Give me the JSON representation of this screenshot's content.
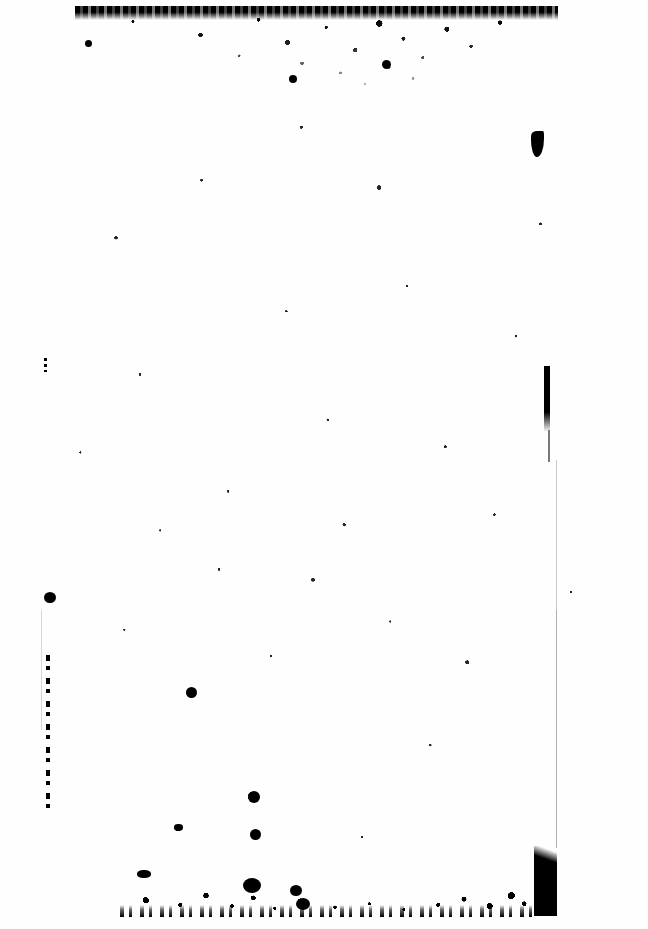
{
  "document": {
    "page_background_color": "#ffffff",
    "ink_color": "#000000",
    "page_width_px": 648,
    "page_height_px": 929,
    "transcribed_text": "",
    "text_present": false,
    "condition_note": ""
  },
  "artifacts": {
    "edge_noise_top": {
      "label": "",
      "x": 75,
      "y": 6,
      "width": 483,
      "height": 103
    },
    "edge_noise_bottom": {
      "label": "",
      "x": 120,
      "y": 855,
      "width": 430,
      "height": 62
    },
    "corner_block_bottom_right": {
      "label": "",
      "x": 534,
      "y": 846,
      "width": 23,
      "height": 70
    },
    "streaks": [
      {
        "name": "right-upper-streak",
        "x": 544,
        "y": 366,
        "width": 6,
        "height": 66
      },
      {
        "name": "right-upper-tail",
        "x": 548,
        "y": 430,
        "width": 2,
        "height": 32
      },
      {
        "name": "left-lower-streak",
        "x": 46,
        "y": 655,
        "width": 4,
        "height": 155
      },
      {
        "name": "left-upper-tick",
        "x": 44,
        "y": 358,
        "width": 3,
        "height": 14
      }
    ],
    "hairlines": [
      {
        "name": "right-edge-hairline-upper",
        "x": 556,
        "y": 460,
        "width": 1,
        "height": 150
      },
      {
        "name": "right-edge-hairline-lower",
        "x": 556,
        "y": 610,
        "width": 1,
        "height": 238
      },
      {
        "name": "left-edge-hairline",
        "x": 41,
        "y": 610,
        "width": 1,
        "height": 120
      }
    ],
    "blots": [
      {
        "name": "blot-top-right-hook",
        "x": 531,
        "y": 131,
        "width": 13,
        "height": 26
      },
      {
        "name": "blot-left-mid",
        "x": 44,
        "y": 592,
        "width": 12,
        "height": 11
      },
      {
        "name": "blot-mid-upper",
        "x": 382,
        "y": 60,
        "width": 9,
        "height": 9
      },
      {
        "name": "blot-center-a",
        "x": 186,
        "y": 687,
        "width": 11,
        "height": 11
      },
      {
        "name": "blot-center-b",
        "x": 248,
        "y": 791,
        "width": 12,
        "height": 12
      },
      {
        "name": "blot-center-c",
        "x": 250,
        "y": 829,
        "width": 11,
        "height": 11
      },
      {
        "name": "blot-center-d",
        "x": 174,
        "y": 824,
        "width": 9,
        "height": 7
      },
      {
        "name": "blot-lower-left",
        "x": 137,
        "y": 870,
        "width": 14,
        "height": 8
      },
      {
        "name": "blot-lower-mid-a",
        "x": 243,
        "y": 878,
        "width": 18,
        "height": 15
      },
      {
        "name": "blot-lower-mid-b",
        "x": 290,
        "y": 885,
        "width": 12,
        "height": 11
      },
      {
        "name": "blot-lower-mid-c",
        "x": 296,
        "y": 898,
        "width": 14,
        "height": 12
      },
      {
        "name": "blot-upper-mid",
        "x": 289,
        "y": 75,
        "width": 8,
        "height": 8
      },
      {
        "name": "blot-top-left",
        "x": 85,
        "y": 40,
        "width": 7,
        "height": 7
      }
    ]
  }
}
